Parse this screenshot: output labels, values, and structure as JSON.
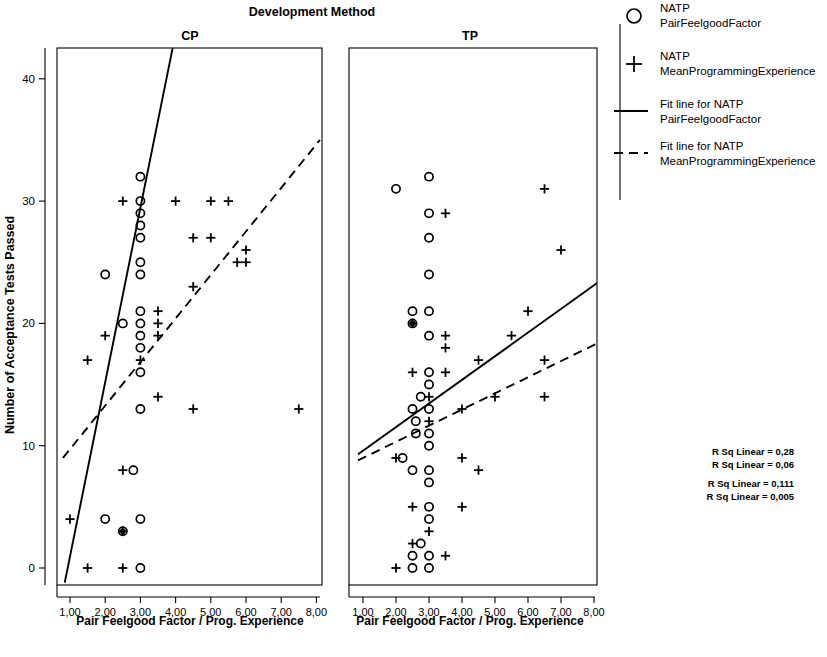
{
  "figure": {
    "super_title": "Development Method",
    "y_axis_title": "Number of Acceptance Tests Passed",
    "x_axis_label": "Pair Feelgood Factor / Prog. Experience",
    "y_ticks": [
      "0",
      "10",
      "20",
      "30",
      "40"
    ],
    "x_ticks": [
      "1,00",
      "2,00",
      "3,00",
      "4,00",
      "5,00",
      "6,00",
      "7,00",
      "8,00"
    ],
    "ink_color": "#000000",
    "background_color": "#ffffff"
  },
  "legend": {
    "items": [
      {
        "symbol": "circle-marker-icon",
        "line1": "NATP",
        "line2": "PairFeelgoodFactor"
      },
      {
        "symbol": "plus-marker-icon",
        "line1": "NATP",
        "line2": "MeanProgrammingExperience"
      },
      {
        "symbol": "solid-line-icon",
        "line1": "Fit line for NATP",
        "line2": "PairFeelgoodFactor"
      },
      {
        "symbol": "dashed-line-icon",
        "line1": "Fit line for NATP",
        "line2": "MeanProgrammingExperience"
      }
    ]
  },
  "annotations": {
    "group_cp": [
      "R Sq Linear = 0,28",
      "R Sq Linear = 0,06"
    ],
    "group_tp": [
      "R Sq Linear = 0,111",
      "R Sq Linear = 0,005"
    ]
  },
  "chart_data": {
    "type": "scatter",
    "title": "Development Method",
    "xlabel": "Pair Feelgood Factor / Prog. Experience",
    "ylabel": "Number of Acceptance Tests Passed",
    "xlim": [
      0.7,
      8.5
    ],
    "ylim": [
      -1.5,
      43
    ],
    "xticks": [
      1,
      2,
      3,
      4,
      5,
      6,
      7,
      8
    ],
    "yticks": [
      0,
      10,
      20,
      30,
      40
    ],
    "grid": false,
    "legend_position": "right",
    "panels": [
      {
        "name": "CP",
        "label": "CP",
        "r_sq_linear_circle": 0.28,
        "r_sq_linear_plus": 0.06,
        "series": [
          {
            "name": "NATP PairFeelgoodFactor",
            "marker": "circle",
            "points": [
              [
                3.0,
                32
              ],
              [
                3.0,
                30
              ],
              [
                3.0,
                29
              ],
              [
                3.0,
                28
              ],
              [
                3.0,
                27
              ],
              [
                3.0,
                25
              ],
              [
                3.0,
                24
              ],
              [
                2.0,
                24
              ],
              [
                3.0,
                21
              ],
              [
                3.0,
                20
              ],
              [
                2.5,
                20
              ],
              [
                3.0,
                19
              ],
              [
                3.0,
                18
              ],
              [
                3.0,
                16
              ],
              [
                3.0,
                13
              ],
              [
                2.8,
                8
              ],
              [
                2.0,
                4
              ],
              [
                3.0,
                4
              ],
              [
                2.5,
                3
              ],
              [
                3.0,
                0
              ]
            ]
          },
          {
            "name": "NATP MeanProgrammingExperience",
            "marker": "plus",
            "points": [
              [
                4.0,
                30
              ],
              [
                5.5,
                30
              ],
              [
                5.0,
                30
              ],
              [
                2.5,
                30
              ],
              [
                5.0,
                27
              ],
              [
                4.5,
                27
              ],
              [
                6.0,
                26
              ],
              [
                6.0,
                25
              ],
              [
                5.75,
                25
              ],
              [
                4.5,
                23
              ],
              [
                1.5,
                17
              ],
              [
                3.5,
                21
              ],
              [
                3.5,
                20
              ],
              [
                3.5,
                19
              ],
              [
                2.0,
                19
              ],
              [
                3.0,
                17
              ],
              [
                3.5,
                14
              ],
              [
                4.5,
                13
              ],
              [
                7.5,
                13
              ],
              [
                2.5,
                8
              ],
              [
                1.0,
                4
              ],
              [
                2.5,
                3
              ],
              [
                1.5,
                0
              ],
              [
                2.5,
                0
              ]
            ]
          }
        ],
        "fit_line_solid": {
          "x1": 0.85,
          "y1": -1.2,
          "x2": 3.95,
          "y2": 43
        },
        "fit_line_dashed": {
          "x1": 0.8,
          "y1": 9,
          "x2": 8.1,
          "y2": 35
        }
      },
      {
        "name": "TP",
        "label": "TP",
        "r_sq_linear_circle": 0.111,
        "r_sq_linear_plus": 0.005,
        "series": [
          {
            "name": "NATP PairFeelgoodFactor",
            "marker": "circle",
            "points": [
              [
                3.0,
                32
              ],
              [
                2.0,
                31
              ],
              [
                3.0,
                29
              ],
              [
                3.0,
                27
              ],
              [
                3.0,
                24
              ],
              [
                2.5,
                21
              ],
              [
                3.0,
                21
              ],
              [
                2.5,
                20
              ],
              [
                3.0,
                19
              ],
              [
                3.0,
                16
              ],
              [
                3.0,
                15
              ],
              [
                2.75,
                14
              ],
              [
                3.0,
                13
              ],
              [
                2.5,
                13
              ],
              [
                2.6,
                12
              ],
              [
                2.6,
                11
              ],
              [
                3.0,
                11
              ],
              [
                3.0,
                10
              ],
              [
                2.2,
                9
              ],
              [
                2.5,
                8
              ],
              [
                3.0,
                8
              ],
              [
                3.0,
                7
              ],
              [
                3.0,
                5
              ],
              [
                3.0,
                4
              ],
              [
                2.75,
                2
              ],
              [
                2.5,
                1
              ],
              [
                3.0,
                1
              ],
              [
                2.5,
                0
              ],
              [
                3.0,
                0
              ]
            ]
          },
          {
            "name": "NATP MeanProgrammingExperience",
            "marker": "plus",
            "points": [
              [
                6.5,
                31
              ],
              [
                3.5,
                29
              ],
              [
                7.0,
                26
              ],
              [
                6.0,
                21
              ],
              [
                2.5,
                20
              ],
              [
                3.5,
                19
              ],
              [
                5.5,
                19
              ],
              [
                3.5,
                18
              ],
              [
                4.5,
                17
              ],
              [
                6.5,
                17
              ],
              [
                2.5,
                16
              ],
              [
                3.5,
                16
              ],
              [
                3.0,
                14
              ],
              [
                5.0,
                14
              ],
              [
                6.5,
                14
              ],
              [
                4.0,
                13
              ],
              [
                3.0,
                12
              ],
              [
                4.0,
                9
              ],
              [
                2.0,
                9
              ],
              [
                4.5,
                8
              ],
              [
                2.5,
                5
              ],
              [
                4.0,
                5
              ],
              [
                3.0,
                3
              ],
              [
                2.5,
                2
              ],
              [
                3.5,
                1
              ],
              [
                2.0,
                0
              ]
            ]
          }
        ],
        "fit_line_solid": {
          "x1": 0.85,
          "y1": 9.3,
          "x2": 8.2,
          "y2": 23.5
        },
        "fit_line_dashed": {
          "x1": 0.85,
          "y1": 8.8,
          "x2": 8.2,
          "y2": 18.5
        }
      }
    ]
  }
}
